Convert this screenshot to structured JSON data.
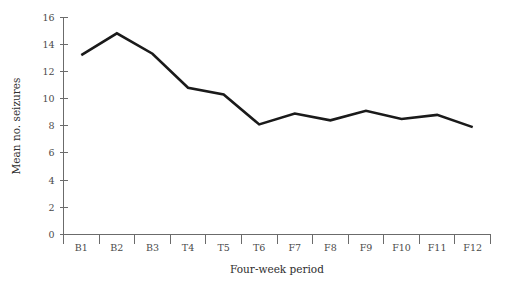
{
  "chart_data": {
    "type": "line",
    "title": "",
    "xlabel": "Four-week period",
    "ylabel": "Mean no. seizures",
    "categories": [
      "B1",
      "B2",
      "B3",
      "T4",
      "T5",
      "T6",
      "F7",
      "F8",
      "F9",
      "F10",
      "F11",
      "F12"
    ],
    "values": [
      13.2,
      14.8,
      13.3,
      10.8,
      10.3,
      8.1,
      8.9,
      8.4,
      9.1,
      8.5,
      8.8,
      7.9
    ],
    "ylim": [
      0,
      16
    ],
    "yticks": [
      0,
      2,
      4,
      6,
      8,
      10,
      12,
      14,
      16
    ],
    "ytick_labels": [
      "0",
      "2",
      "4",
      "6",
      "8",
      "10",
      "12",
      "14",
      "16"
    ],
    "grid": false,
    "legend": "none",
    "series": [
      {
        "name": "Mean no. seizures",
        "values": [
          13.2,
          14.8,
          13.3,
          10.8,
          10.3,
          8.1,
          8.9,
          8.4,
          9.1,
          8.5,
          8.8,
          7.9
        ],
        "color": "#1a1a1a"
      }
    ]
  },
  "colors": {
    "line": "#1a1a1a",
    "axis": "#6b6b6b",
    "tick_text": "#4a4a4a",
    "title_text": "#2e2e2e",
    "background": "#ffffff"
  }
}
